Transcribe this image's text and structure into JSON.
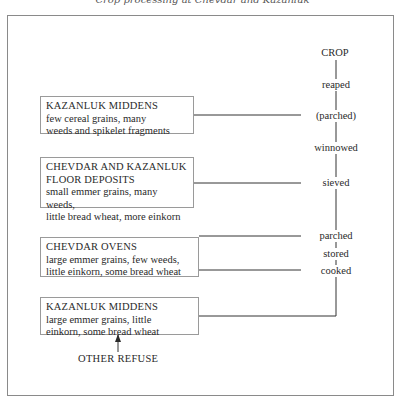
{
  "header": {
    "text": "Crop processing at Chevdar and Kazanluk"
  },
  "diagram": {
    "process_chain": {
      "start": "CROP",
      "stages": [
        "reaped",
        "(parched)",
        "winnowed",
        "sieved",
        "parched",
        "stored",
        "cooked"
      ]
    },
    "sources": [
      {
        "title": "KAZANLUK MIDDENS",
        "lines": [
          "few cereal grains, many",
          "weeds and spikelet fragments"
        ],
        "arrow_to": "(parched)"
      },
      {
        "title_lines": [
          "CHEVDAR AND KAZANLUK",
          "FLOOR DEPOSITS"
        ],
        "lines": [
          "small emmer grains, many weeds,",
          "little bread wheat, more einkorn"
        ],
        "arrow_to": "sieved"
      },
      {
        "title": "CHEVDAR OVENS",
        "lines": [
          "large emmer grains, few weeds,",
          "little einkorn, some bread wheat"
        ],
        "arrow_to": [
          "parched",
          "cooked"
        ]
      },
      {
        "title": "KAZANLUK MIDDENS",
        "lines": [
          "large emmer grains, little",
          "einkorn, some bread wheat"
        ],
        "link_to": "cooked"
      }
    ],
    "other_refuse": "OTHER REFUSE"
  }
}
